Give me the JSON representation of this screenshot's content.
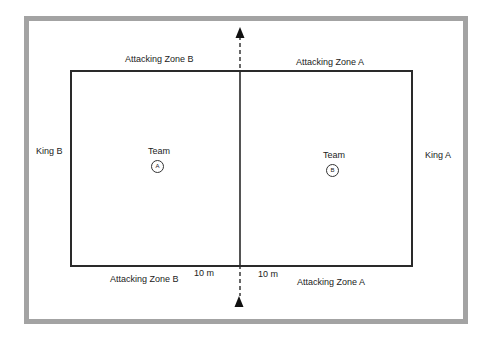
{
  "diagram": {
    "zones": {
      "top_left": "Attacking Zone B",
      "top_right": "Attacking Zone A",
      "bottom_left": "Attacking Zone B",
      "bottom_right": "Attacking Zone A"
    },
    "kings": {
      "left": "King B",
      "right": "King A"
    },
    "teams": [
      {
        "label": "Team",
        "marker": "A"
      },
      {
        "label": "Team",
        "marker": "B"
      }
    ],
    "distances": {
      "left": "10 m",
      "right": "10 m"
    },
    "colors": {
      "frame": "#a3a3a3",
      "lines": "#2a2a2a",
      "background": "#ffffff"
    }
  }
}
